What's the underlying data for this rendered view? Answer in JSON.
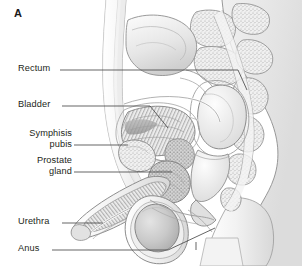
{
  "figure": {
    "panel_letter": "A",
    "background_color": "#ffffff",
    "line_color": "#7a7a7a",
    "label_color": "#231f20",
    "width": 302,
    "height": 266
  },
  "labels": [
    {
      "id": "rectum",
      "text": "Rectum",
      "x": 18,
      "y": 63,
      "align": "left",
      "leader": {
        "from_x": 60,
        "from_y": 70,
        "to_x": 238,
        "to_y": 70,
        "tail_x": 247,
        "tail_y": 90
      }
    },
    {
      "id": "bladder",
      "text": "Bladder",
      "x": 18,
      "y": 99,
      "align": "left",
      "leader": {
        "from_x": 62,
        "from_y": 106,
        "to_x": 150,
        "to_y": 106,
        "tail_x": 168,
        "tail_y": 128
      }
    },
    {
      "id": "symphisis-pubis",
      "text": "Symphisis\npubis",
      "x": 10,
      "y": 128,
      "align": "right",
      "leader": {
        "from_x": 74,
        "from_y": 145,
        "to_x": 128,
        "to_y": 145,
        "tail_x": 128,
        "tail_y": 145
      }
    },
    {
      "id": "prostate-gland",
      "text": "Prostate\ngland",
      "x": 10,
      "y": 155,
      "align": "right",
      "leader": {
        "from_x": 74,
        "from_y": 172,
        "to_x": 172,
        "to_y": 172,
        "tail_x": 172,
        "tail_y": 172
      }
    },
    {
      "id": "urethra",
      "text": "Urethra",
      "x": 18,
      "y": 216,
      "align": "left",
      "leader": {
        "from_x": 62,
        "from_y": 223,
        "to_x": 103,
        "to_y": 223,
        "tail_x": 103,
        "tail_y": 223
      }
    },
    {
      "id": "anus",
      "text": "Anus",
      "x": 18,
      "y": 243,
      "align": "left",
      "leader": {
        "from_x": 52,
        "from_y": 250,
        "to_x": 168,
        "to_y": 250,
        "tail_x": 215,
        "tail_y": 228
      }
    }
  ]
}
